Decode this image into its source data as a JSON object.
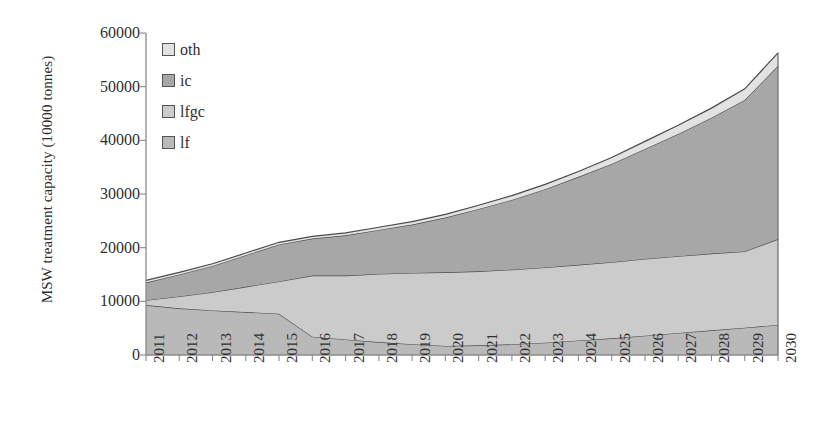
{
  "chart_data": {
    "type": "area",
    "stacked": true,
    "title": "",
    "xlabel": "",
    "ylabel": "MSW treatment capacity (10000 tonnes)",
    "ylim": [
      0,
      60000
    ],
    "ytick_labels": [
      "0",
      "10000",
      "20000",
      "30000",
      "40000",
      "50000",
      "60000"
    ],
    "ytick_values": [
      0,
      10000,
      20000,
      30000,
      40000,
      50000,
      60000
    ],
    "grid": false,
    "legend_position": "top-left",
    "categories": [
      "2011",
      "2012",
      "2013",
      "2014",
      "2015",
      "2016",
      "2017",
      "2018",
      "2019",
      "2020",
      "2021",
      "2022",
      "2023",
      "2024",
      "2025",
      "2026",
      "2027",
      "2028",
      "2029",
      "2030"
    ],
    "series": [
      {
        "name": "lf",
        "color": "#b9b9b9",
        "values": [
          9300,
          8700,
          8300,
          8000,
          7700,
          3400,
          2900,
          2400,
          2000,
          1700,
          1800,
          2000,
          2300,
          2700,
          3100,
          3600,
          4100,
          4600,
          5100,
          5600
        ]
      },
      {
        "name": "lfgc",
        "color": "#cbcbcb",
        "values": [
          900,
          2200,
          3400,
          4700,
          6000,
          11400,
          11900,
          12700,
          13300,
          13700,
          13800,
          13900,
          14000,
          14100,
          14200,
          14300,
          14300,
          14300,
          14200,
          16000
        ]
      },
      {
        "name": "ic",
        "color": "#a7a7a7",
        "values": [
          3300,
          4100,
          4900,
          5900,
          6900,
          6900,
          7500,
          8200,
          9000,
          10200,
          11600,
          13000,
          14600,
          16400,
          18300,
          20500,
          22800,
          25300,
          28200,
          32300
        ]
      },
      {
        "name": "oth",
        "color": "#e2e2e2",
        "values": [
          400,
          400,
          400,
          400,
          400,
          400,
          450,
          500,
          550,
          600,
          700,
          800,
          900,
          1000,
          1200,
          1400,
          1600,
          1800,
          2100,
          2400
        ]
      }
    ],
    "legend": [
      {
        "label": "oth",
        "color": "#e2e2e2"
      },
      {
        "label": "ic",
        "color": "#a7a7a7"
      },
      {
        "label": "lfgc",
        "color": "#cbcbcb"
      },
      {
        "label": "lf",
        "color": "#b9b9b9"
      }
    ],
    "axis": {
      "line_color": "#8a8a8a",
      "plot_left_px": 146,
      "plot_right_px": 778,
      "plot_top_px": 33,
      "plot_bottom_px": 355
    }
  }
}
